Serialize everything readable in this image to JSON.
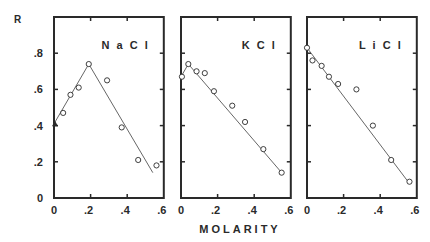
{
  "figure": {
    "ylabel": "R",
    "xlabel": "MOLARITY",
    "y_ticks": [
      "0",
      ".2",
      ".4",
      ".6",
      ".8"
    ],
    "x_ticks": [
      "0",
      ".2",
      ".4",
      ".6"
    ],
    "colors": {
      "ink": "#2a2a2a",
      "background": "#ffffff"
    }
  },
  "chart_data": [
    {
      "type": "scatter",
      "title": "NaCl",
      "xlabel": "MOLARITY",
      "ylabel": "R",
      "xlim": [
        0,
        0.6
      ],
      "ylim": [
        0,
        1.0
      ],
      "x_ticks": [
        0,
        0.2,
        0.4,
        0.6
      ],
      "y_ticks": [
        0,
        0.2,
        0.4,
        0.6,
        0.8
      ],
      "points": [
        {
          "x": 0.0,
          "y": 0.41,
          "marker": "triangle"
        },
        {
          "x": 0.05,
          "y": 0.47
        },
        {
          "x": 0.09,
          "y": 0.57
        },
        {
          "x": 0.135,
          "y": 0.61
        },
        {
          "x": 0.19,
          "y": 0.74
        },
        {
          "x": 0.29,
          "y": 0.65
        },
        {
          "x": 0.37,
          "y": 0.39
        },
        {
          "x": 0.46,
          "y": 0.21
        },
        {
          "x": 0.56,
          "y": 0.18
        }
      ],
      "fit_line": [
        {
          "x": 0.0,
          "y": 0.41
        },
        {
          "x": 0.19,
          "y": 0.74
        },
        {
          "x": 0.54,
          "y": 0.14
        }
      ]
    },
    {
      "type": "scatter",
      "title": "KCl",
      "xlabel": "MOLARITY",
      "ylabel": "R",
      "xlim": [
        0,
        0.6
      ],
      "ylim": [
        0,
        1.0
      ],
      "x_ticks": [
        0,
        0.2,
        0.4,
        0.6
      ],
      "y_ticks": [
        0,
        0.2,
        0.4,
        0.6,
        0.8
      ],
      "points": [
        {
          "x": 0.005,
          "y": 0.67
        },
        {
          "x": 0.04,
          "y": 0.74
        },
        {
          "x": 0.085,
          "y": 0.7
        },
        {
          "x": 0.13,
          "y": 0.69
        },
        {
          "x": 0.18,
          "y": 0.59
        },
        {
          "x": 0.28,
          "y": 0.51
        },
        {
          "x": 0.35,
          "y": 0.42
        },
        {
          "x": 0.45,
          "y": 0.27
        },
        {
          "x": 0.55,
          "y": 0.14
        }
      ],
      "fit_line": [
        {
          "x": 0.0,
          "y": 0.67
        },
        {
          "x": 0.04,
          "y": 0.74
        },
        {
          "x": 0.55,
          "y": 0.14
        }
      ]
    },
    {
      "type": "scatter",
      "title": "LiCl",
      "xlabel": "MOLARITY",
      "ylabel": "R",
      "xlim": [
        0,
        0.6
      ],
      "ylim": [
        0,
        1.0
      ],
      "x_ticks": [
        0,
        0.2,
        0.4,
        0.6
      ],
      "y_ticks": [
        0,
        0.2,
        0.4,
        0.6,
        0.8
      ],
      "points": [
        {
          "x": 0.0,
          "y": 0.83
        },
        {
          "x": 0.03,
          "y": 0.76
        },
        {
          "x": 0.08,
          "y": 0.73
        },
        {
          "x": 0.12,
          "y": 0.67
        },
        {
          "x": 0.17,
          "y": 0.63
        },
        {
          "x": 0.27,
          "y": 0.6
        },
        {
          "x": 0.36,
          "y": 0.4
        },
        {
          "x": 0.46,
          "y": 0.21
        },
        {
          "x": 0.56,
          "y": 0.09
        }
      ],
      "fit_line": [
        {
          "x": 0.0,
          "y": 0.83
        },
        {
          "x": 0.56,
          "y": 0.08
        }
      ]
    }
  ]
}
